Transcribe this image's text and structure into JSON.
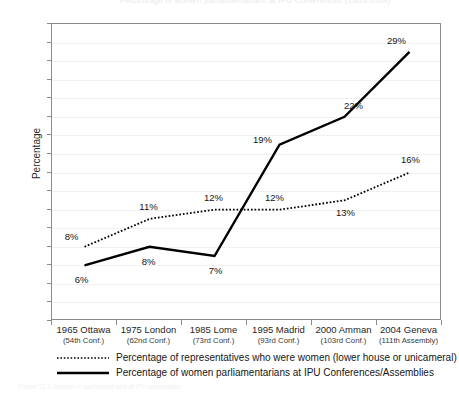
{
  "figure": {
    "title_remnant": "Percentage of women parliamentarians at IPU Conferences (1965-2004)",
    "caption": "Figure 12.1 Women in parliament and at IPU assemblies"
  },
  "axes": {
    "ylabel": "Percentage",
    "yticks": [
      0,
      2,
      4,
      6,
      8,
      10,
      12,
      14,
      16,
      18,
      20,
      22,
      24,
      26,
      28,
      30,
      32
    ],
    "ylim": [
      0,
      32
    ],
    "grid": true
  },
  "legend": {
    "position": "below-axes",
    "entries": [
      {
        "style": "dotted",
        "label": "Percentage of representatives who were women (lower house or unicameral)"
      },
      {
        "style": "solid",
        "label": "Percentage of women parliamentarians at IPU Conferences/Assemblies"
      }
    ]
  },
  "chart_data": {
    "type": "line",
    "title": "",
    "xlabel": "",
    "ylabel": "Percentage",
    "ylim": [
      0,
      32
    ],
    "ytick_step": 2,
    "grid": true,
    "legend_position": "below",
    "categories": [
      "1965 Ottawa",
      "1975 London",
      "1985 Lome",
      "1995 Madrid",
      "2000 Amman",
      "2004 Geneva"
    ],
    "category_sublabels": [
      "(54th Conf.)",
      "(62nd Conf.)",
      "(73rd Conf.)",
      "(93rd Conf.)",
      "(103rd Conf.)",
      "(111th Assembly)"
    ],
    "series": [
      {
        "name": "Percentage of representatives who were women (lower house or unicameral)",
        "style": "dotted",
        "values": [
          8,
          11,
          12,
          12,
          13,
          16
        ],
        "labels": [
          "8%",
          "11%",
          "12%",
          "12%",
          "13%",
          "16%"
        ]
      },
      {
        "name": "Percentage of women parliamentarians at IPU Conferences/Assemblies",
        "style": "solid",
        "values": [
          6,
          8,
          7,
          19,
          22,
          29
        ],
        "labels": [
          "6%",
          "8%",
          "7%",
          "19%",
          "22%",
          "29%"
        ]
      }
    ]
  },
  "colors": {
    "line": "#000000",
    "axis": "#8b8b8b",
    "grid": "#f0f0f0",
    "text": "#1a1a1a"
  }
}
